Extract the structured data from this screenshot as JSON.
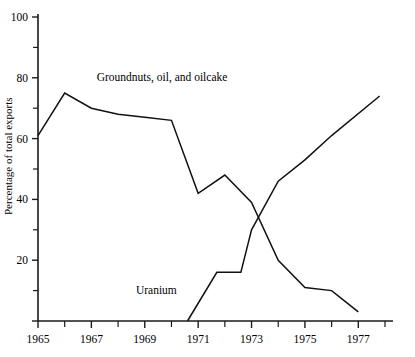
{
  "chart_data": {
    "type": "line",
    "title": "",
    "xlabel": "",
    "ylabel": "Percentage of total exports",
    "xlim": [
      1965,
      1978
    ],
    "ylim": [
      0,
      100
    ],
    "grid": false,
    "legend_position": "inline-annotation",
    "x_ticks": [
      1965,
      1967,
      1969,
      1971,
      1973,
      1975,
      1977
    ],
    "x_tick_labels": [
      "1965",
      "1967",
      "1969",
      "1971",
      "1973",
      "1975",
      "1977"
    ],
    "x_minor_ticks": [
      1966,
      1968,
      1970,
      1972,
      1974,
      1976,
      1978
    ],
    "y_ticks": [
      0,
      20,
      40,
      60,
      80,
      100
    ],
    "y_tick_labels": [
      "",
      "20",
      "40",
      "60",
      "80",
      "100"
    ],
    "y_minor_ticks": [
      10,
      30,
      50,
      70,
      90
    ],
    "series": [
      {
        "name": "Groundnuts, oil, and oilcake",
        "label": "Groundnuts, oil, and oilcake",
        "label_x": 1967.2,
        "label_y": 79,
        "color": "#111111",
        "x": [
          1965,
          1966,
          1967,
          1968,
          1969,
          1970,
          1971,
          1972,
          1973,
          1974,
          1975,
          1976,
          1977
        ],
        "values": [
          61,
          75,
          70,
          68,
          67,
          66,
          42,
          48,
          39,
          20,
          11,
          10,
          3
        ]
      },
      {
        "name": "Uranium",
        "label": "Uranium",
        "label_x": 1970.2,
        "label_y": 9,
        "color": "#111111",
        "x": [
          1970.6,
          1971.7,
          1972.6,
          1973,
          1974,
          1975,
          1976,
          1977.8
        ],
        "values": [
          0,
          16,
          16,
          30,
          46,
          53,
          61,
          74
        ]
      }
    ],
    "annotations": [
      {
        "text": "Groundnuts, oil, and oilcake",
        "x": 1967.2,
        "y": 79
      },
      {
        "text": "Uranium",
        "x": 1970.2,
        "y": 9
      }
    ]
  }
}
